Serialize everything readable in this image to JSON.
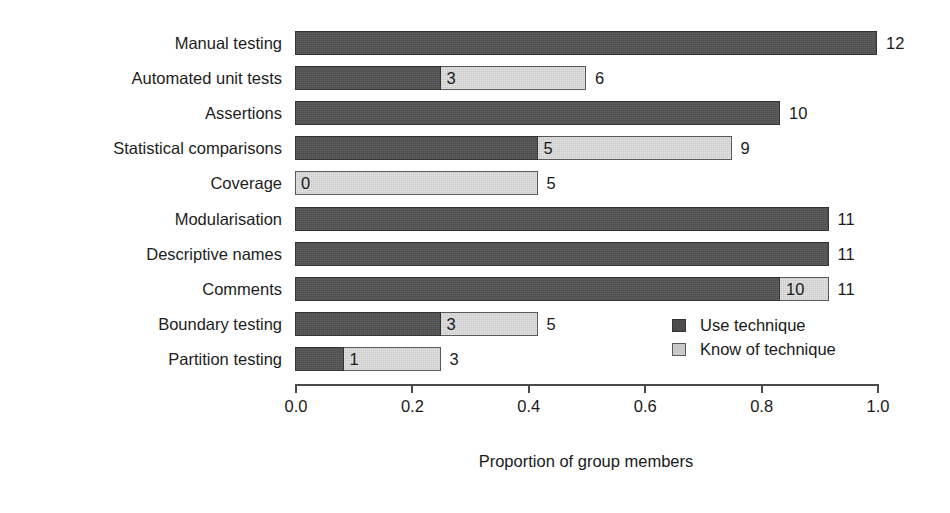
{
  "chart_data": {
    "type": "bar",
    "orientation": "horizontal",
    "stacked": true,
    "title": "",
    "xlabel": "Proportion of group members",
    "ylabel": "",
    "xlim": [
      0.0,
      1.0
    ],
    "grid": false,
    "group_size": 12,
    "xticks": [
      "0.0",
      "0.2",
      "0.4",
      "0.6",
      "0.8",
      "1.0"
    ],
    "xtick_values": [
      0.0,
      0.2,
      0.4,
      0.6,
      0.8,
      1.0
    ],
    "legend": {
      "position": "inside-right",
      "entries": [
        {
          "label": "Use technique",
          "color": "#4d4d4d",
          "key": "use"
        },
        {
          "label": "Know of technique",
          "color": "#c9c9c9",
          "key": "know"
        }
      ]
    },
    "categories": [
      "Manual testing",
      "Automated unit tests",
      "Assertions",
      "Statistical comparisons",
      "Coverage",
      "Modularisation",
      "Descriptive names",
      "Comments",
      "Boundary testing",
      "Partition testing"
    ],
    "series": [
      {
        "name": "Use technique",
        "color": "#4d4d4d",
        "values": [
          12,
          3,
          10,
          5,
          0,
          11,
          11,
          10,
          3,
          1
        ],
        "proportions": [
          1.0,
          0.25,
          0.833,
          0.417,
          0.0,
          0.917,
          0.917,
          0.833,
          0.25,
          0.083
        ]
      },
      {
        "name": "Know of technique",
        "color": "#c9c9c9",
        "values": [
          12,
          6,
          10,
          9,
          5,
          11,
          11,
          11,
          5,
          3
        ],
        "proportions": [
          1.0,
          0.5,
          0.833,
          0.75,
          0.417,
          0.917,
          0.917,
          0.917,
          0.417,
          0.25
        ]
      }
    ],
    "rows": [
      {
        "category": "Manual testing",
        "use": 12,
        "know": 12,
        "use_label": "",
        "total_label": "12",
        "show_use_label": false
      },
      {
        "category": "Automated unit tests",
        "use": 3,
        "know": 6,
        "use_label": "3",
        "total_label": "6",
        "show_use_label": true
      },
      {
        "category": "Assertions",
        "use": 10,
        "know": 10,
        "use_label": "",
        "total_label": "10",
        "show_use_label": false
      },
      {
        "category": "Statistical comparisons",
        "use": 5,
        "know": 9,
        "use_label": "5",
        "total_label": "9",
        "show_use_label": true
      },
      {
        "category": "Coverage",
        "use": 0,
        "know": 5,
        "use_label": "0",
        "total_label": "5",
        "show_use_label": true
      },
      {
        "category": "Modularisation",
        "use": 11,
        "know": 11,
        "use_label": "",
        "total_label": "11",
        "show_use_label": false
      },
      {
        "category": "Descriptive names",
        "use": 11,
        "know": 11,
        "use_label": "",
        "total_label": "11",
        "show_use_label": false
      },
      {
        "category": "Comments",
        "use": 10,
        "know": 11,
        "use_label": "10",
        "total_label": "11",
        "show_use_label": true
      },
      {
        "category": "Boundary testing",
        "use": 3,
        "know": 5,
        "use_label": "3",
        "total_label": "5",
        "show_use_label": true
      },
      {
        "category": "Partition testing",
        "use": 1,
        "know": 3,
        "use_label": "1",
        "total_label": "3",
        "show_use_label": true
      }
    ]
  }
}
